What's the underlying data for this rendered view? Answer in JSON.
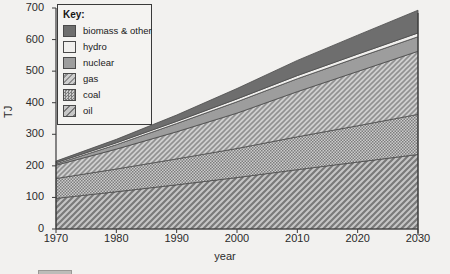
{
  "chart_data": {
    "type": "area",
    "title": "",
    "xlabel": "year",
    "ylabel": "TJ",
    "grid": false,
    "stacked": true,
    "legend_position": "top-left",
    "legend_title": "Key:",
    "xlim": [
      1970,
      2030
    ],
    "ylim": [
      0,
      700
    ],
    "x": [
      1970,
      1980,
      1990,
      2000,
      2010,
      2020,
      2030
    ],
    "xticks": [
      "1970",
      "1980",
      "1990",
      "2000",
      "2010",
      "2020",
      "2030"
    ],
    "yticks": [
      "0",
      "100",
      "200",
      "300",
      "400",
      "500",
      "600",
      "700"
    ],
    "series": [
      {
        "name": "oil",
        "swatch": "diagonal-hatch-light",
        "color": "#a8a8a8",
        "values": [
          97,
          118,
          140,
          163,
          188,
          212,
          236
        ]
      },
      {
        "name": "coal",
        "swatch": "dotted-dense",
        "color": "#b4b4b4",
        "values": [
          63,
          72,
          82,
          92,
          104,
          115,
          127
        ]
      },
      {
        "name": "gas",
        "swatch": "diagonal-hatch",
        "color": "#bdbdbd",
        "values": [
          42,
          63,
          86,
          112,
          143,
          172,
          200
        ]
      },
      {
        "name": "nuclear",
        "swatch": "solid-mid-gray",
        "color": "#9d9d9d",
        "values": [
          4,
          14,
          26,
          36,
          41,
          44,
          46
        ]
      },
      {
        "name": "hydro",
        "swatch": "solid-white",
        "color": "#f0efed",
        "values": [
          4,
          6,
          7,
          9,
          10,
          11,
          12
        ]
      },
      {
        "name": "biomass & other",
        "swatch": "solid-dark-gray",
        "color": "#6e6e6e",
        "values": [
          5,
          11,
          20,
          33,
          48,
          60,
          72
        ]
      }
    ],
    "totals": [
      215,
      284,
      361,
      445,
      534,
      614,
      693
    ]
  },
  "axis": {
    "y_title": "TJ",
    "x_title": "year"
  },
  "legend": {
    "title": "Key:",
    "items": [
      {
        "label": "biomass & other"
      },
      {
        "label": "hydro"
      },
      {
        "label": "nuclear"
      },
      {
        "label": "gas"
      },
      {
        "label": "coal"
      },
      {
        "label": "oil"
      }
    ]
  },
  "colors": {
    "background": "#f2f1ef",
    "axis": "#3a3a3a",
    "text": "#2b2b2b",
    "biomass": "#6e6e6e",
    "hydro": "#f0efed",
    "nuclear": "#9d9d9d",
    "gas": "#bdbdbd",
    "coal": "#b4b4b4",
    "oil": "#a8a8a8"
  }
}
